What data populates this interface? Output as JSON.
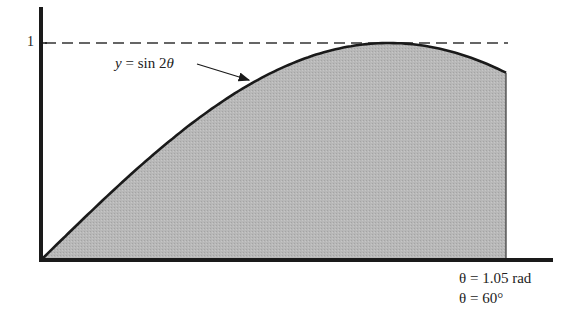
{
  "diagram": {
    "title": "",
    "y_tick_label": "1",
    "curve_label": "y = sin 2θ",
    "curve_label_parts": {
      "var": "y",
      "eq": " = sin 2",
      "theta": "θ"
    },
    "x_end_label_rad": "θ = 1.05 rad",
    "x_end_label_deg": "θ = 60°",
    "colors": {
      "axis": "#1a1a1a",
      "curve": "#1a1a1a",
      "fill": "#b5b5b5",
      "dashed": "#333333",
      "text": "#222222"
    }
  },
  "chart_data": {
    "type": "area",
    "title": "",
    "function": "y = sin 2θ",
    "xlabel": "θ",
    "ylabel": "y",
    "x_range": [
      0,
      1.05
    ],
    "ylim": [
      0,
      1
    ],
    "y_ticks": [
      1
    ],
    "reference_line": {
      "y": 1,
      "style": "dashed"
    },
    "shaded_region": {
      "from": 0,
      "to": 1.05,
      "unit": "rad"
    },
    "annotations": [
      "y = sin 2θ",
      "θ = 1.05 rad",
      "θ = 60°"
    ],
    "x": [
      0,
      0.15,
      0.3,
      0.45,
      0.6,
      0.75,
      0.785,
      0.9,
      1.05
    ],
    "values": [
      0,
      0.296,
      0.565,
      0.783,
      0.932,
      0.997,
      1.0,
      0.974,
      0.863
    ]
  }
}
